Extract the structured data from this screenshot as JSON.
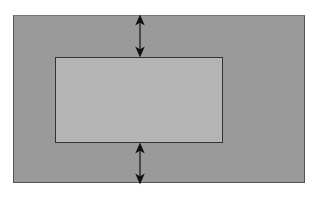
{
  "diagram": {
    "type": "box-model-margin",
    "outer_box": {
      "color": "#9a9a9a",
      "border": "#555555"
    },
    "inner_box": {
      "color": "#b4b4b4",
      "border": "#333333"
    },
    "arrows": [
      {
        "name": "top-margin-arrow",
        "direction": "vertical-double",
        "x": 140,
        "y1": 16,
        "y2": 56
      },
      {
        "name": "bottom-margin-arrow",
        "direction": "vertical-double",
        "x": 140,
        "y1": 144,
        "y2": 183
      }
    ],
    "arrow_color": "#111111"
  }
}
